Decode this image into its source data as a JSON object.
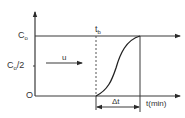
{
  "diagram": {
    "type": "breakthrough-curve",
    "y_axis": {
      "labels": {
        "c0": "C",
        "c0_sub": "o",
        "half": "C",
        "half_sub": "o",
        "half_suffix": "/2",
        "zero": "O"
      }
    },
    "x_axis": {
      "label": "t(min)"
    },
    "annotations": {
      "tb": "t",
      "tb_sub": "b",
      "velocity": "u",
      "delta_t": "Δt"
    },
    "colors": {
      "line": "#3a3a3a",
      "background": "#ffffff"
    }
  }
}
